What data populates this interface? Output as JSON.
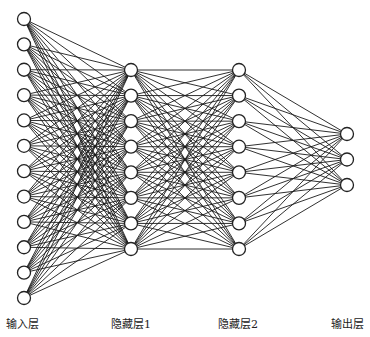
{
  "diagram": {
    "type": "fully-connected-neural-network",
    "layers": [
      {
        "name": "输入层",
        "nodes": 12,
        "x": 24,
        "y_first": 19,
        "y_last": 298,
        "label_x": 22
      },
      {
        "name": "隐藏层1",
        "nodes": 8,
        "x": 131,
        "y_first": 70,
        "y_last": 249,
        "label_x": 131
      },
      {
        "name": "隐藏层2",
        "nodes": 8,
        "x": 239,
        "y_first": 70,
        "y_last": 249,
        "label_x": 238
      },
      {
        "name": "输出层",
        "nodes": 3,
        "x": 347,
        "y_first": 134,
        "y_last": 185,
        "label_x": 347
      }
    ],
    "node_radius": 6.5,
    "edge_color": "#1a1a1a",
    "node_stroke": "#222222",
    "node_fill": "#ffffff"
  }
}
